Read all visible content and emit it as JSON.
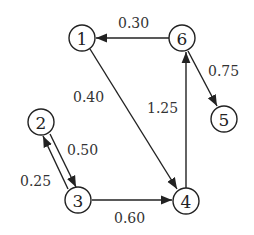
{
  "diagram": {
    "type": "directed-weighted-graph",
    "nodes": [
      {
        "id": "1",
        "label": "1",
        "x": 82,
        "y": 38
      },
      {
        "id": "6",
        "label": "6",
        "x": 182,
        "y": 38
      },
      {
        "id": "2",
        "label": "2",
        "x": 41,
        "y": 122
      },
      {
        "id": "5",
        "label": "5",
        "x": 224,
        "y": 119
      },
      {
        "id": "3",
        "label": "3",
        "x": 78,
        "y": 200
      },
      {
        "id": "4",
        "label": "4",
        "x": 186,
        "y": 201
      }
    ],
    "edges": [
      {
        "from": "6",
        "to": "1",
        "weight": "0.30"
      },
      {
        "from": "1",
        "to": "4",
        "weight": "0.40"
      },
      {
        "from": "4",
        "to": "6",
        "weight": "1.25"
      },
      {
        "from": "6",
        "to": "5",
        "weight": "0.75"
      },
      {
        "from": "2",
        "to": "3",
        "weight": "0.50"
      },
      {
        "from": "3",
        "to": "2",
        "weight": "0.25"
      },
      {
        "from": "3",
        "to": "4",
        "weight": "0.60"
      }
    ]
  }
}
